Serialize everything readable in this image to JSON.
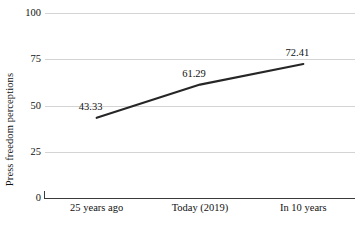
{
  "chart_data": {
    "type": "line",
    "title": "",
    "subtitle": "",
    "xlabel": "",
    "ylabel": "Press freedom perceptions",
    "categories": [
      "25 years ago",
      "Today (2019)",
      "In 10 years"
    ],
    "values": [
      43.33,
      61.29,
      72.41
    ],
    "data_labels": [
      "43.33",
      "61.29",
      "72.41"
    ],
    "ylim": [
      0,
      100
    ],
    "y_ticks": [
      100,
      75,
      50,
      25,
      0
    ],
    "y_tick_labels": [
      "100",
      "75",
      "50",
      "25",
      "0"
    ],
    "grid": "horizontal",
    "legend": "none",
    "series": [
      {
        "name": "Press freedom perceptions",
        "values": [
          43.33,
          61.29,
          72.41
        ],
        "color": "#262626"
      }
    ],
    "colors": {
      "line": "#262626",
      "gridline": "#d4d4d4",
      "axis": "#3a3a3a",
      "text": "#111111",
      "background": "#ffffff"
    }
  }
}
